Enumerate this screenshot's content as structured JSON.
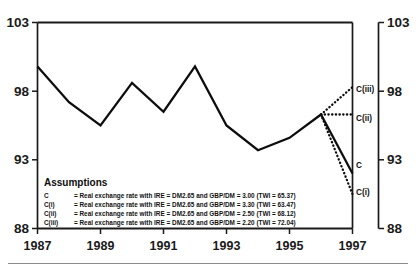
{
  "chart_data": {
    "type": "line",
    "title": "",
    "xlabel": "",
    "ylabel": "",
    "xlim": [
      1987,
      1997
    ],
    "ylim": [
      88,
      103
    ],
    "grid": false,
    "legend_position": "inside-bottom-left",
    "x": [
      1987,
      1988,
      1989,
      1990,
      1991,
      1992,
      1993,
      1994,
      1995,
      1996
    ],
    "y_ticks": [
      88,
      93,
      98,
      103
    ],
    "x_ticks": [
      1987,
      1989,
      1991,
      1993,
      1995,
      1997
    ],
    "y_ticks_right": [
      88,
      93,
      98,
      103
    ],
    "series": [
      {
        "name": "Real exchange rate index (history)",
        "style": "solid",
        "x": [
          1987,
          1988,
          1989,
          1990,
          1991,
          1992,
          1993,
          1994,
          1995,
          1996
        ],
        "values": [
          99.8,
          97.2,
          95.5,
          98.6,
          96.5,
          99.8,
          95.5,
          93.7,
          94.6,
          96.3
        ]
      },
      {
        "name": "C",
        "style": "solid",
        "x": [
          1996,
          1997
        ],
        "values": [
          96.3,
          92.0
        ],
        "end_label": "C"
      },
      {
        "name": "C(i)",
        "style": "dotted",
        "x": [
          1996,
          1997
        ],
        "values": [
          96.3,
          90.5
        ],
        "end_label": "C(i)"
      },
      {
        "name": "C(ii)",
        "style": "dotted",
        "x": [
          1996,
          1997
        ],
        "values": [
          96.3,
          96.3
        ],
        "end_label": "C(ii)"
      },
      {
        "name": "C(iii)",
        "style": "dotted",
        "x": [
          1996,
          1997
        ],
        "values": [
          96.3,
          98.3
        ],
        "end_label": "C(iii)"
      }
    ],
    "annotations": {
      "legend_title": "Assumptions",
      "rows": [
        {
          "key": "C",
          "text": "=  Real exchange rate with IRE = DM2.65 and GBP/DM = 3.00 (TWI = 65.37)",
          "gbp_dm": 3.0,
          "twi": 65.37
        },
        {
          "key": "C(i)",
          "text": "=  Real exchange rate with IRE = DM2.65 and GBP/DM = 3.30 (TWI = 63.47)",
          "gbp_dm": 3.3,
          "twi": 63.47
        },
        {
          "key": "C(ii)",
          "text": "=  Real exchange rate with IRE = DM2.65 and GBP/DM = 2.50 (TWI = 68.12)",
          "gbp_dm": 2.5,
          "twi": 68.12
        },
        {
          "key": "C(iii)",
          "text": "=  Real exchange rate with IRE = DM2.65 and GBP/DM = 2.20 (TWI = 72.04)",
          "gbp_dm": 2.2,
          "twi": 72.04
        }
      ]
    }
  },
  "axes": {
    "left": {
      "t103": "103",
      "t98": "98",
      "t93": "93",
      "t88": "88"
    },
    "right": {
      "t103": "103",
      "t98": "98",
      "t93": "93",
      "t88": "88"
    },
    "bottom": {
      "t1987": "1987",
      "t1989": "1989",
      "t1991": "1991",
      "t1993": "1993",
      "t1995": "1995",
      "t1997": "1997"
    }
  },
  "curve_labels": {
    "c": "C",
    "ci": "C(i)",
    "cii": "C(ii)",
    "ciii": "C(iii)"
  },
  "legend": {
    "title": "Assumptions",
    "k0": "C",
    "k1": "C(i)",
    "k2": "C(ii)",
    "k3": "C(iii)",
    "t0": "=  Real exchange rate with IRE = DM2.65 and GBP/DM = 3.00 (TWI = 65.37)",
    "t1": "=  Real exchange rate with IRE = DM2.65 and GBP/DM = 3.30 (TWI = 63.47)",
    "t2": "=  Real exchange rate with IRE = DM2.65 and GBP/DM = 2.50 (TWI = 68.12)",
    "t3": "=  Real exchange rate with IRE = DM2.65 and GBP/DM = 2.20 (TWI = 72.04)"
  },
  "colors": {
    "line": "#0d0d0d",
    "axis": "#1a1a1a",
    "text": "#111111",
    "rule": "#8a8a8a",
    "background": "#ffffff"
  }
}
